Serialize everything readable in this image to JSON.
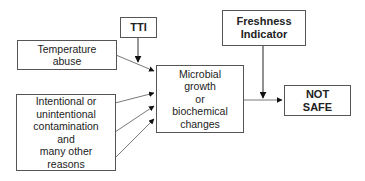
{
  "diagram": {
    "nodes": {
      "tti": {
        "lines": [
          "TTI"
        ]
      },
      "temperature_abuse": {
        "lines": [
          "Temperature",
          "abuse"
        ]
      },
      "contamination": {
        "lines": [
          "Intentional or",
          "unintentional",
          "contamination",
          "and",
          "many other",
          "reasons"
        ]
      },
      "microbial": {
        "lines": [
          "Microbial",
          "growth",
          "or",
          "biochemical",
          "changes"
        ]
      },
      "freshness": {
        "lines": [
          "Freshness",
          "Indicator"
        ]
      },
      "not_safe": {
        "lines": [
          "NOT",
          "SAFE"
        ]
      }
    },
    "edges": [
      {
        "from": "tti",
        "to": "microbial"
      },
      {
        "from": "temperature_abuse",
        "to": "microbial"
      },
      {
        "from": "contamination",
        "to": "microbial",
        "count": 3
      },
      {
        "from": "microbial",
        "to": "not_safe"
      },
      {
        "from": "freshness",
        "to": "microbial-to-not_safe-link"
      }
    ]
  }
}
